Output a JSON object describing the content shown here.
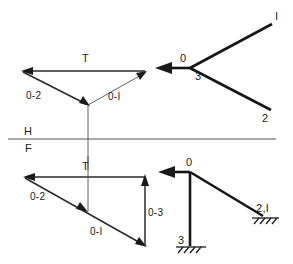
{
  "figure": {
    "width": 293,
    "height": 264,
    "background_color": "#ffffff",
    "line_color": "#1a1a1a",
    "reference_line_color": "#555555"
  },
  "reference_line": {
    "name": "horizontal-frontal reference line",
    "upper_label": "H",
    "lower_label": "F"
  },
  "top_view": {
    "name": "top view of tripod",
    "apex_label": "0",
    "leg_labels": {
      "leg_3": "3",
      "leg_1": "I",
      "leg_2": "2"
    }
  },
  "front_view": {
    "name": "front view of tripod",
    "apex_label": "0",
    "leg_labels": {
      "leg_3": "3",
      "legs_2_1": "2,I"
    }
  },
  "top_force_polygon": {
    "name": "top view force triangle",
    "labels": {
      "load": "T",
      "member_0_2": "0-2",
      "member_0_1": "0-I"
    }
  },
  "front_force_polygon": {
    "name": "front view force polygon",
    "labels": {
      "load": "T",
      "member_0_2": "0-2",
      "member_0_1": "0-I",
      "member_0_3": "0-3"
    }
  }
}
